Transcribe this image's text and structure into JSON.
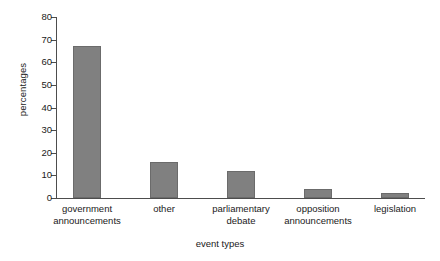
{
  "chart_data": {
    "type": "bar",
    "title": "",
    "xlabel": "event types",
    "ylabel": "percentages",
    "categories": [
      "government announcements",
      "other",
      "parliamentary debate",
      "opposition announcements",
      "legislation"
    ],
    "category_lines": [
      [
        "government",
        "announcements"
      ],
      [
        "other"
      ],
      [
        "parliamentary",
        "debate"
      ],
      [
        "opposition",
        "announcements"
      ],
      [
        "legislation"
      ]
    ],
    "values": [
      67,
      16,
      12,
      4,
      2
    ],
    "ylim": [
      0,
      80
    ],
    "yticks": [
      0,
      10,
      20,
      30,
      40,
      50,
      60,
      70,
      80
    ],
    "ytick_labels": [
      "0",
      "10",
      "20",
      "30",
      "40",
      "50",
      "60",
      "70",
      "80"
    ],
    "grid": false,
    "legend": "none",
    "bar_color": "#808080",
    "bar_edge_color": "#6b6b6b",
    "axis_color": "#4d4d4d",
    "background": "#ffffff"
  }
}
